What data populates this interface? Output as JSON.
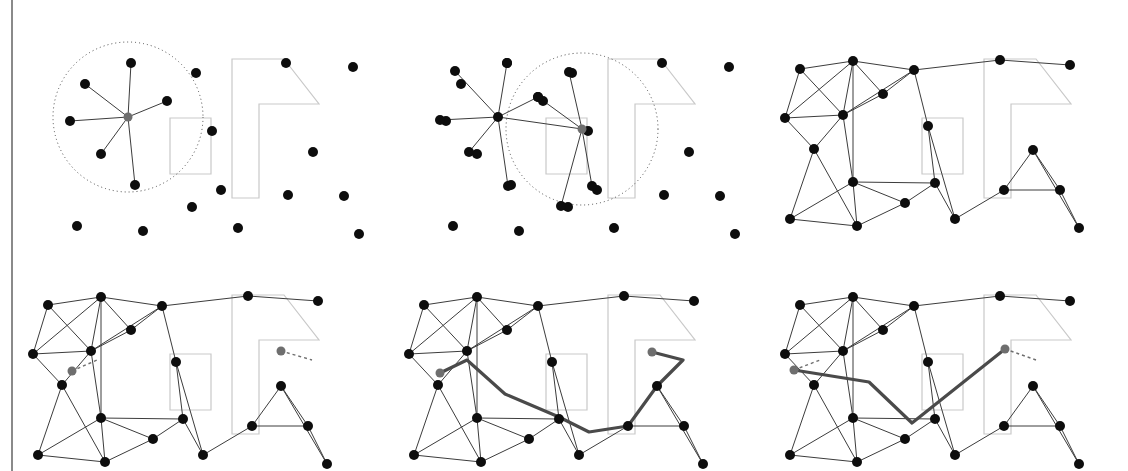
{
  "figure": {
    "panel_count": 6,
    "layout": {
      "rows": 2,
      "cols": 3,
      "panel_width": 376,
      "panel_height": 235
    },
    "colors": {
      "node": "#0d0d0d",
      "query_node": "#6e6e6e",
      "edge": "#3c3c3c",
      "obstacle": "#c9c9c9",
      "radius_circle": "#4a4a4a",
      "connection_dashed": "#6e6e6e",
      "path_highlight": "#4a4a4a",
      "background": "#ffffff",
      "left_rule": "#8a8a8a"
    },
    "styles": {
      "node_radius": 5,
      "query_node_radius": 4.5,
      "edge_width": 1,
      "obstacle_width": 1.2,
      "path_width": 3.2,
      "circle_dash": "1 3",
      "connection_dash": "3 3"
    }
  },
  "obstacles": [
    {
      "name": "rectangle-obstacle",
      "points": "170,118 211,118 211,174 170,174"
    },
    {
      "name": "L-shaped-obstacle",
      "points": "232,59 284,59 319,104 259,104 259,198 232,198"
    }
  ],
  "samples": [
    {
      "id": 0,
      "x": 131,
      "y": 63
    },
    {
      "id": 1,
      "x": 85,
      "y": 84
    },
    {
      "id": 2,
      "x": 167,
      "y": 101
    },
    {
      "id": 3,
      "x": 70,
      "y": 121
    },
    {
      "id": 4,
      "x": 101,
      "y": 154
    },
    {
      "id": 5,
      "x": 135,
      "y": 185
    },
    {
      "id": 6,
      "x": 196,
      "y": 73
    },
    {
      "id": 7,
      "x": 212,
      "y": 131
    },
    {
      "id": 8,
      "x": 286,
      "y": 63
    },
    {
      "id": 9,
      "x": 353,
      "y": 67
    },
    {
      "id": 10,
      "x": 313,
      "y": 152
    },
    {
      "id": 11,
      "x": 221,
      "y": 190
    },
    {
      "id": 12,
      "x": 288,
      "y": 195
    },
    {
      "id": 13,
      "x": 344,
      "y": 196
    },
    {
      "id": 14,
      "x": 192,
      "y": 207
    },
    {
      "id": 15,
      "x": 77,
      "y": 226
    },
    {
      "id": 16,
      "x": 143,
      "y": 231
    },
    {
      "id": 17,
      "x": 238,
      "y": 228
    },
    {
      "id": 18,
      "x": 359,
      "y": 234
    }
  ],
  "panel1": {
    "name": "sampling-with-connection-radius",
    "center_node": {
      "x": 128,
      "y": 117
    },
    "radius_circle": {
      "cx": 128,
      "cy": 117,
      "r": 75
    },
    "neighbors": [
      {
        "x": 167,
        "y": 101
      },
      {
        "x": 131,
        "y": 63
      },
      {
        "x": 85,
        "y": 84
      },
      {
        "x": 70,
        "y": 121
      },
      {
        "x": 101,
        "y": 154
      },
      {
        "x": 135,
        "y": 185
      }
    ]
  },
  "panel2": {
    "name": "second-sample-expansion",
    "offset_x": 376,
    "hub_node": {
      "x": 122,
      "y": 117
    },
    "center_node": {
      "x": 206,
      "y": 129
    },
    "radius_circle": {
      "cx": 206,
      "cy": 129,
      "r": 76
    },
    "hub_neighbors": [
      {
        "x": 131,
        "y": 63
      },
      {
        "x": 79,
        "y": 71
      },
      {
        "x": 64,
        "y": 120
      },
      {
        "x": 93,
        "y": 152
      },
      {
        "x": 132,
        "y": 186
      },
      {
        "x": 162,
        "y": 97
      }
    ],
    "center_neighbors": [
      {
        "x": 162,
        "y": 97
      },
      {
        "x": 193,
        "y": 72
      },
      {
        "x": 216,
        "y": 186
      },
      {
        "x": 185,
        "y": 206
      }
    ]
  },
  "panel3": {
    "name": "completed-roadmap",
    "offset_x": 752,
    "nodes": [
      {
        "id": "A",
        "x": 48,
        "y": 69
      },
      {
        "id": "B",
        "x": 101,
        "y": 61
      },
      {
        "id": "C",
        "x": 162,
        "y": 70
      },
      {
        "id": "D",
        "x": 131,
        "y": 94
      },
      {
        "id": "E",
        "x": 33,
        "y": 118
      },
      {
        "id": "F",
        "x": 91,
        "y": 115
      },
      {
        "id": "G",
        "x": 62,
        "y": 149
      },
      {
        "id": "H",
        "x": 176,
        "y": 126
      },
      {
        "id": "I",
        "x": 101,
        "y": 182
      },
      {
        "id": "J",
        "x": 38,
        "y": 219
      },
      {
        "id": "K",
        "x": 105,
        "y": 226
      },
      {
        "id": "L",
        "x": 153,
        "y": 203
      },
      {
        "id": "M",
        "x": 183,
        "y": 183
      },
      {
        "id": "N",
        "x": 203,
        "y": 219
      },
      {
        "id": "O",
        "x": 248,
        "y": 60
      },
      {
        "id": "P",
        "x": 318,
        "y": 65
      },
      {
        "id": "Q",
        "x": 252,
        "y": 190
      },
      {
        "id": "R",
        "x": 281,
        "y": 150
      },
      {
        "id": "S",
        "x": 308,
        "y": 190
      },
      {
        "id": "T",
        "x": 327,
        "y": 228
      }
    ],
    "edges": [
      [
        "A",
        "B"
      ],
      [
        "B",
        "C"
      ],
      [
        "C",
        "O"
      ],
      [
        "O",
        "P"
      ],
      [
        "A",
        "E"
      ],
      [
        "A",
        "F"
      ],
      [
        "B",
        "E"
      ],
      [
        "B",
        "F"
      ],
      [
        "B",
        "D"
      ],
      [
        "B",
        "I"
      ],
      [
        "C",
        "D"
      ],
      [
        "C",
        "F"
      ],
      [
        "C",
        "H"
      ],
      [
        "D",
        "F"
      ],
      [
        "E",
        "F"
      ],
      [
        "E",
        "G"
      ],
      [
        "F",
        "G"
      ],
      [
        "F",
        "I"
      ],
      [
        "G",
        "J"
      ],
      [
        "G",
        "K"
      ],
      [
        "H",
        "M"
      ],
      [
        "I",
        "J"
      ],
      [
        "I",
        "K"
      ],
      [
        "I",
        "L"
      ],
      [
        "I",
        "M"
      ],
      [
        "J",
        "K"
      ],
      [
        "K",
        "L"
      ],
      [
        "L",
        "M"
      ],
      [
        "M",
        "N"
      ],
      [
        "H",
        "N"
      ],
      [
        "N",
        "Q"
      ],
      [
        "Q",
        "R"
      ],
      [
        "Q",
        "S"
      ],
      [
        "R",
        "S"
      ],
      [
        "R",
        "T"
      ],
      [
        "S",
        "T"
      ]
    ]
  },
  "panel4": {
    "name": "query-connection",
    "offset_x": 0,
    "offset_y": 236,
    "start_node": {
      "x": 72,
      "y": 135,
      "label": "start"
    },
    "goal_node": {
      "x": 281,
      "y": 115,
      "label": "goal"
    },
    "start_link": {
      "x1": 72,
      "y1": 135,
      "x2": 97,
      "y2": 124
    },
    "goal_link": {
      "x1": 281,
      "y1": 115,
      "x2": 312,
      "y2": 124
    }
  },
  "panel5": {
    "name": "path-found",
    "offset_x": 376,
    "offset_y": 236,
    "start_node": {
      "x": 64,
      "y": 137
    },
    "goal_node": {
      "x": 276,
      "y": 116
    },
    "path_points": "64,137 91,124 129,158 183,181 213,196 252,190 281,150 307,124 276,116"
  },
  "panel6": {
    "name": "path-smoothed",
    "offset_x": 752,
    "offset_y": 236,
    "start_node": {
      "x": 42,
      "y": 134
    },
    "goal_node": {
      "x": 253,
      "y": 113
    },
    "start_link": {
      "x1": 42,
      "y1": 134,
      "x2": 68,
      "y2": 124
    },
    "goal_link": {
      "x1": 253,
      "y1": 113,
      "x2": 284,
      "y2": 124
    },
    "smoothed_points": "42,134 117,146 160,187 253,113"
  },
  "descriptions": {
    "panel1": "Random sample with connection radius neighborhood",
    "panel2": "Next sample connects to nearby milestones",
    "panel3": "Full roadmap after all samples connected",
    "panel4": "Start and goal attached to roadmap",
    "panel5": "Graph search yields a path",
    "panel6": "Path shortcut smoothing"
  }
}
